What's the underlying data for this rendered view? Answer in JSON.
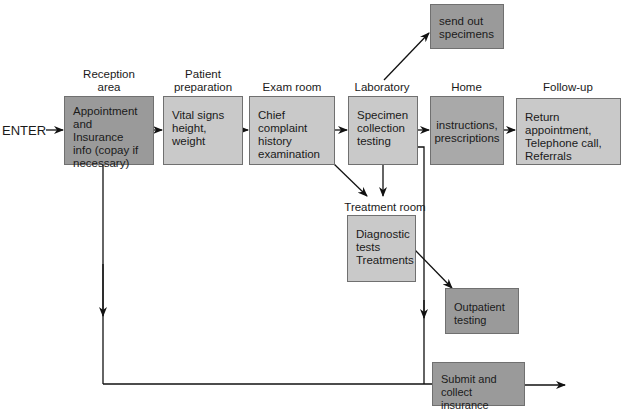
{
  "diagram": {
    "entry_label": "ENTER",
    "stages": [
      {
        "id": "reception",
        "header": "Reception\narea",
        "text": "Appointment\nand Insurance\ninfo (copay if\nnecessary)"
      },
      {
        "id": "patient-prep",
        "header": "Patient\npreparation",
        "text": "Vital signs\nheight,\nweight"
      },
      {
        "id": "exam",
        "header": "Exam room",
        "text": "Chief complaint\nhistory\nexamination"
      },
      {
        "id": "laboratory",
        "header": "Laboratory",
        "text": "Specimen\ncollection\ntesting"
      },
      {
        "id": "home",
        "header": "Home",
        "text": "instructions,\nprescriptions"
      },
      {
        "id": "follow-up",
        "header": "Follow-up",
        "text": "Return appointment,\nTelephone call,\nReferrals"
      }
    ],
    "send_out": {
      "text": "send out\nspecimens"
    },
    "treatment": {
      "header": "Treatment room",
      "text": "Diagnostic\ntests\nTreatments"
    },
    "outpatient": {
      "text": "Outpatient\ntesting"
    },
    "billing": {
      "text": "Submit and\ncollect insurance"
    },
    "colors": {
      "dark_box": "#9a9a9a",
      "home_box": "#a9a9a9",
      "light_box": "#c9c9c9",
      "line": "#111111"
    }
  }
}
